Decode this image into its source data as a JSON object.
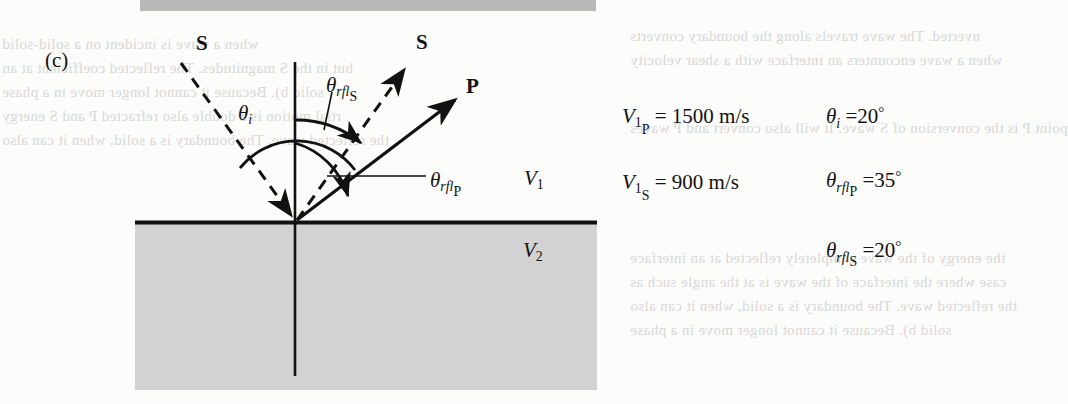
{
  "figure": {
    "panel_label": "(c)",
    "medium_labels": {
      "upper": "V",
      "upper_sub": "1",
      "lower": "V",
      "lower_sub": "2"
    },
    "rays": [
      {
        "name": "incident-s-wave",
        "label": "S",
        "style": "dashed",
        "direction": "incoming-from-upper-left"
      },
      {
        "name": "reflected-s-wave",
        "label": "S",
        "style": "dashed",
        "direction": "outgoing-upper-right"
      },
      {
        "name": "reflected-p-wave",
        "label": "P",
        "style": "solid",
        "direction": "outgoing-upper-right"
      }
    ],
    "angle_labels": [
      {
        "name": "theta-incident",
        "symbol": "θ",
        "sub": "i"
      },
      {
        "name": "theta-reflected-s",
        "symbol": "θ",
        "sub_ital": "rfl",
        "sub_up": "S"
      },
      {
        "name": "theta-reflected-p",
        "symbol": "θ",
        "sub_ital": "rfl",
        "sub_up": "P"
      }
    ]
  },
  "values": {
    "velocity": [
      {
        "name": "v1p",
        "symbol": "V",
        "sub": "1",
        "sub2": "P",
        "eq": "=",
        "value": "1500 m/s"
      },
      {
        "name": "v1s",
        "symbol": "V",
        "sub": "1",
        "sub2": "S",
        "eq": "=",
        "value": "900 m/s"
      }
    ],
    "angles": [
      {
        "name": "theta-i",
        "symbol": "θ",
        "sub": "i",
        "eq": "=",
        "value": "20",
        "unit": "°"
      },
      {
        "name": "theta-rfl-p",
        "symbol": "θ",
        "sub_ital": "rfl",
        "sub_up": "P",
        "eq": "=",
        "value": "35",
        "unit": "°"
      },
      {
        "name": "theta-rfl-s",
        "symbol": "θ",
        "sub_ital": "rfl",
        "sub_up": "S",
        "eq": "=",
        "value": "20",
        "unit": "°"
      }
    ]
  },
  "colors": {
    "page": "#fcfcfb",
    "ink": "#111111",
    "medium2_fill": "#d2d2d2",
    "top_strip": "#b9b9b9",
    "bleed_text": "#d8d8d6"
  },
  "bleed_text": {
    "lines": [
      "when a wave is incident on a solid-solid",
      "but in the S magnitudes. The reflected coefficient at an",
      "solid b). Because it cannot longer move in a phase",
      "rtial motion is a double also refracted P and S energy",
      "the reflected wave. The boundary is a solid, when it can also",
      "nverted. The wave travels along the boundary converts",
      "when a wave encounters an interface with a shear velocity",
      "point P is the conversion of S wave. It will also convert and P waves",
      "the energy of the wave completely reflected at an interface",
      "case where the interface of the wave is at the angle such as"
    ]
  }
}
